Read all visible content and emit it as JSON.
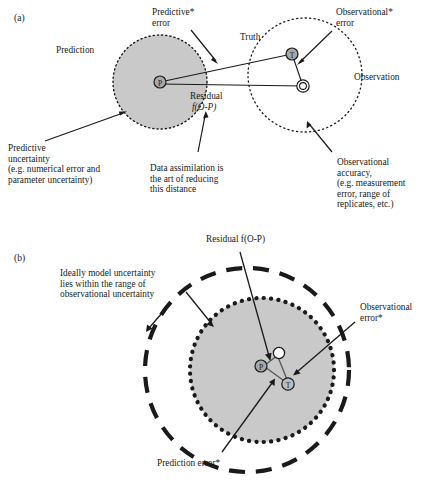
{
  "figure": {
    "panels": [
      {
        "id": "(a)",
        "labels": {
          "prediction": "Prediction",
          "predictive_error": "Predictive*\nerror",
          "truth": "Truth",
          "observational_error": "Observational*\nerror",
          "observation": "Observation",
          "residual": "Residual",
          "residual_fn": "f(O-P)",
          "predictive_uncertainty": "Predictive\nuncertainty\n(e.g. numerical error and\nparameter uncertainty)",
          "data_assimilation": "Data assimilation is\nthe art of reducing\nthis distance",
          "observational_accuracy": "Observational\naccuracy,\n(e.g. measurement\nerror, range of\nreplicates, etc.)"
        },
        "markers": [
          {
            "name": "prediction-marker",
            "letter": "P",
            "style": "filled-gray"
          },
          {
            "name": "truth-marker",
            "letter": "T",
            "style": "filled-gray"
          },
          {
            "name": "observation-marker",
            "letter": "O",
            "style": "open"
          }
        ],
        "circles": [
          {
            "name": "prediction-uncertainty-circle",
            "style": "dotted",
            "fill": "#c9c9c9"
          },
          {
            "name": "observational-accuracy-circle",
            "style": "dotted",
            "fill": "none"
          }
        ]
      },
      {
        "id": "(b)",
        "labels": {
          "residual": "Residual f(O-P)",
          "ideally_model": "Ideally model uncertainty\nlies within the range of\nobservational uncertainty",
          "observational_error": "Observational\nerror*",
          "prediction_error": "Prediction error*"
        },
        "markers": [
          {
            "name": "prediction-marker",
            "letter": "P",
            "style": "filled-gray"
          },
          {
            "name": "observation-marker",
            "letter": "O",
            "style": "open-white"
          },
          {
            "name": "truth-marker",
            "letter": "T",
            "style": "open"
          }
        ],
        "circles": [
          {
            "name": "observational-uncertainty-circle",
            "style": "dashed",
            "fill": "none"
          },
          {
            "name": "model-uncertainty-circle",
            "style": "dotted",
            "fill": "#c9c9c9"
          }
        ]
      }
    ],
    "colors": {
      "gray_fill": "#c9c9c9",
      "marker_gray": "#a8a8a8",
      "stroke": "#1a1a1a"
    }
  }
}
